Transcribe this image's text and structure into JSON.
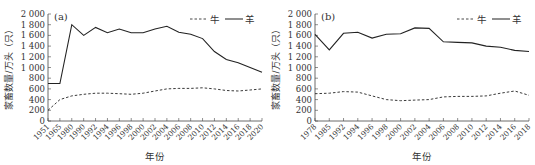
{
  "chart_data": [
    {
      "type": "line",
      "panel_label": "(a)",
      "title": "",
      "xlabel": "年份",
      "ylabel": "家畜数量/万头（只）",
      "ylim": [
        0,
        2000
      ],
      "yticks": [
        0,
        200,
        400,
        600,
        800,
        1000,
        1200,
        1400,
        1600,
        1800,
        2000
      ],
      "x_axis_type": "categorical",
      "x_axis_note": "Tick labels are evenly spaced but years are not: 1951→1965 (14 yr), 1965→1980 (15 yr), 1980→1990 (10 yr), then 2-yr steps. Slopes in the early segment are not comparable to later biennial steps.",
      "categories": [
        "1951",
        "1965",
        "1980",
        "1990",
        "1992",
        "1994",
        "1996",
        "1998",
        "2000",
        "2002",
        "2004",
        "2006",
        "2008",
        "2010",
        "2012",
        "2014",
        "2016",
        "2018",
        "2020"
      ],
      "legend": [
        "牛",
        "羊"
      ],
      "series": [
        {
          "name": "牛",
          "style": "dashed",
          "values": [
            200,
            400,
            470,
            500,
            520,
            520,
            510,
            500,
            520,
            560,
            600,
            610,
            610,
            620,
            600,
            570,
            560,
            580,
            600
          ]
        },
        {
          "name": "羊",
          "style": "solid",
          "values": [
            700,
            700,
            1800,
            1600,
            1750,
            1650,
            1720,
            1650,
            1650,
            1720,
            1770,
            1660,
            1620,
            1540,
            1300,
            1150,
            1090,
            1000,
            910
          ]
        }
      ],
      "values_note": "Visual estimates at labeled slots, approx ±30."
    },
    {
      "type": "line",
      "panel_label": "(b)",
      "title": "",
      "xlabel": "年份",
      "ylabel": "家畜数量/万头（只）",
      "ylim": [
        0,
        2000
      ],
      "yticks": [
        0,
        200,
        400,
        600,
        800,
        1000,
        1200,
        1400,
        1600,
        1800,
        2000
      ],
      "x_axis_type": "categorical",
      "x_axis_note": "Tick labels are evenly spaced but years are not: 1978→1985 (7 yr), 1985→1992 (7 yr), then 2-yr steps.",
      "categories": [
        "1978",
        "1985",
        "1992",
        "1994",
        "1996",
        "1998",
        "2000",
        "2002",
        "2004",
        "2006",
        "2008",
        "2010",
        "2012",
        "2014",
        "2016",
        "2018"
      ],
      "legend": [
        "牛",
        "羊"
      ],
      "series": [
        {
          "name": "牛",
          "style": "dashed",
          "values": [
            510,
            520,
            550,
            540,
            470,
            400,
            380,
            390,
            400,
            450,
            460,
            460,
            470,
            520,
            560,
            480
          ]
        },
        {
          "name": "羊",
          "style": "solid",
          "values": [
            1620,
            1330,
            1640,
            1660,
            1550,
            1620,
            1630,
            1740,
            1730,
            1480,
            1470,
            1460,
            1400,
            1380,
            1320,
            1300
          ]
        }
      ],
      "values_note": "Visual estimates at labeled slots, approx ±30."
    }
  ]
}
